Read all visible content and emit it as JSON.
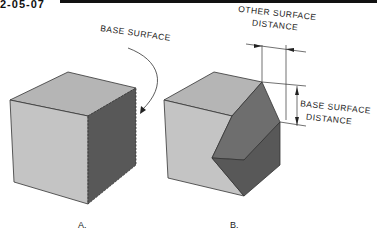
{
  "header": {
    "fragment": "2-05-07"
  },
  "figure_a": {
    "label": "A.",
    "callout": "BASE SURFACE"
  },
  "figure_b": {
    "label": "B.",
    "dim_other_line1": "OTHER SURFACE",
    "dim_other_line2": "DISTANCE",
    "dim_base_line1": "BASE SURFACE",
    "dim_base_line2": "DISTANCE"
  },
  "colors": {
    "front_face": "#c4c4c4",
    "top_face": "#b5b5b5",
    "side_face": "#5a5a5a",
    "chamfer_face": "#7a7a7a",
    "line": "#222222"
  }
}
